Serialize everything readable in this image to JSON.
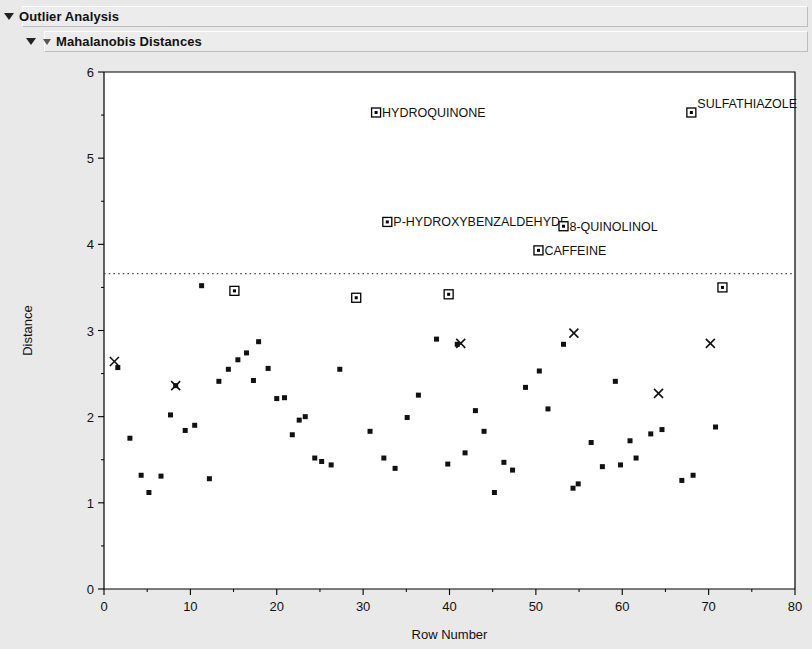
{
  "window": {
    "outline": [
      {
        "label": "Outlier Analysis",
        "expanded": true,
        "level": 0
      },
      {
        "label": "Mahalanobis Distances",
        "expanded": true,
        "level": 1
      }
    ]
  },
  "chart_data": {
    "type": "scatter",
    "title": "Mahalanobis Distances",
    "xlabel": "Row Number",
    "ylabel": "Distance",
    "xlim": [
      0,
      80
    ],
    "ylim": [
      0,
      6
    ],
    "xticks": [
      0,
      10,
      20,
      30,
      40,
      50,
      60,
      70,
      80
    ],
    "xticklabels": [
      "0",
      "10",
      "20",
      "30",
      "40",
      "50",
      "60",
      "70",
      "80"
    ],
    "xminorticks": [
      5,
      15,
      25,
      35,
      45,
      55,
      65,
      75
    ],
    "yticks": [
      0,
      1,
      2,
      3,
      4,
      5,
      6
    ],
    "yticklabels": [
      "0",
      "1",
      "2",
      "3",
      "4",
      "5",
      "6"
    ],
    "yminorticks": [
      0.5,
      1.5,
      2.5,
      3.5,
      4.5,
      5.5
    ],
    "grid": false,
    "legend": null,
    "reference_line": {
      "value": 3.66,
      "style": "dotted",
      "label": ""
    },
    "series": [
      {
        "name": "Distance",
        "marker": "square",
        "points": [
          {
            "x": 1.6,
            "y": 2.57
          },
          {
            "x": 3.0,
            "y": 1.75
          },
          {
            "x": 4.3,
            "y": 1.32
          },
          {
            "x": 5.2,
            "y": 1.12
          },
          {
            "x": 6.6,
            "y": 1.31
          },
          {
            "x": 7.7,
            "y": 2.02
          },
          {
            "x": 8.3,
            "y": 2.36
          },
          {
            "x": 9.4,
            "y": 1.84
          },
          {
            "x": 10.5,
            "y": 1.9
          },
          {
            "x": 11.3,
            "y": 3.52
          },
          {
            "x": 12.2,
            "y": 1.28
          },
          {
            "x": 13.3,
            "y": 2.41
          },
          {
            "x": 14.4,
            "y": 2.55
          },
          {
            "x": 15.5,
            "y": 2.66
          },
          {
            "x": 16.5,
            "y": 2.74
          },
          {
            "x": 17.3,
            "y": 2.42
          },
          {
            "x": 17.9,
            "y": 2.87
          },
          {
            "x": 19.0,
            "y": 2.56
          },
          {
            "x": 20.0,
            "y": 2.21
          },
          {
            "x": 20.9,
            "y": 2.22
          },
          {
            "x": 21.8,
            "y": 1.79
          },
          {
            "x": 22.6,
            "y": 1.96
          },
          {
            "x": 23.3,
            "y": 2.0
          },
          {
            "x": 24.4,
            "y": 1.52
          },
          {
            "x": 25.2,
            "y": 1.48
          },
          {
            "x": 26.3,
            "y": 1.44
          },
          {
            "x": 27.3,
            "y": 2.55
          },
          {
            "x": 30.8,
            "y": 1.83
          },
          {
            "x": 32.4,
            "y": 1.52
          },
          {
            "x": 33.7,
            "y": 1.4
          },
          {
            "x": 35.1,
            "y": 1.99
          },
          {
            "x": 36.4,
            "y": 2.25
          },
          {
            "x": 38.5,
            "y": 2.9
          },
          {
            "x": 39.8,
            "y": 1.45
          },
          {
            "x": 40.9,
            "y": 2.84
          },
          {
            "x": 41.8,
            "y": 1.58
          },
          {
            "x": 43.0,
            "y": 2.07
          },
          {
            "x": 44.0,
            "y": 1.83
          },
          {
            "x": 45.2,
            "y": 1.12
          },
          {
            "x": 46.3,
            "y": 1.47
          },
          {
            "x": 47.3,
            "y": 1.38
          },
          {
            "x": 48.8,
            "y": 2.34
          },
          {
            "x": 50.4,
            "y": 2.53
          },
          {
            "x": 51.4,
            "y": 2.09
          },
          {
            "x": 53.2,
            "y": 2.84
          },
          {
            "x": 54.3,
            "y": 1.17
          },
          {
            "x": 54.9,
            "y": 1.22
          },
          {
            "x": 56.4,
            "y": 1.7
          },
          {
            "x": 57.7,
            "y": 1.42
          },
          {
            "x": 59.2,
            "y": 2.41
          },
          {
            "x": 59.8,
            "y": 1.44
          },
          {
            "x": 60.9,
            "y": 1.72
          },
          {
            "x": 61.6,
            "y": 1.52
          },
          {
            "x": 63.3,
            "y": 1.8
          },
          {
            "x": 64.6,
            "y": 1.85
          },
          {
            "x": 66.9,
            "y": 1.26
          },
          {
            "x": 68.2,
            "y": 1.32
          },
          {
            "x": 70.8,
            "y": 1.88
          }
        ]
      },
      {
        "name": "Highlighted rows",
        "marker": "x",
        "points": [
          {
            "x": 1.2,
            "y": 2.64
          },
          {
            "x": 8.3,
            "y": 2.36
          },
          {
            "x": 41.3,
            "y": 2.85
          },
          {
            "x": 54.4,
            "y": 2.97
          },
          {
            "x": 64.2,
            "y": 2.27
          },
          {
            "x": 70.2,
            "y": 2.85
          }
        ]
      },
      {
        "name": "Outliers",
        "marker": "open-square",
        "points": [
          {
            "x": 15.1,
            "y": 3.46,
            "label": ""
          },
          {
            "x": 29.2,
            "y": 3.38,
            "label": ""
          },
          {
            "x": 39.9,
            "y": 3.42,
            "label": ""
          },
          {
            "x": 71.6,
            "y": 3.5,
            "label": ""
          },
          {
            "x": 31.5,
            "y": 5.53,
            "label": "HYDROQUINONE",
            "label_pos": "right"
          },
          {
            "x": 68.0,
            "y": 5.53,
            "label": "SULFATHIAZOLE",
            "label_pos": "right-up"
          },
          {
            "x": 32.8,
            "y": 4.26,
            "label": "P-HYDROXYBENZALDEHYDE",
            "label_pos": "right"
          },
          {
            "x": 53.2,
            "y": 4.21,
            "label": "8-QUINOLINOL",
            "label_pos": "right"
          },
          {
            "x": 50.3,
            "y": 3.93,
            "label": "CAFFEINE",
            "label_pos": "right"
          }
        ]
      }
    ]
  }
}
